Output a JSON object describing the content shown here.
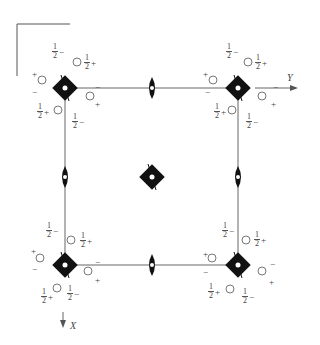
{
  "diagram": {
    "type": "space-group symmetry diagram",
    "axes": {
      "y_label": "Y",
      "x_label": "X"
    },
    "fraction": {
      "num": "1",
      "den": "2"
    },
    "signs": {
      "plus": "+",
      "minus": "−"
    },
    "corners": [
      {
        "id": "top-left"
      },
      {
        "id": "top-right"
      },
      {
        "id": "bottom-left"
      },
      {
        "id": "bottom-right"
      }
    ],
    "symbols": {
      "corner": "4-fold rotoinversion (filled square with dot)",
      "center": "4-fold rotoinversion (filled square with dot)",
      "edge": "2-fold axis (filled lens)",
      "general": "circle with comma"
    },
    "colors": {
      "ink": "#111111",
      "line": "#555555",
      "background": "#ffffff"
    }
  }
}
